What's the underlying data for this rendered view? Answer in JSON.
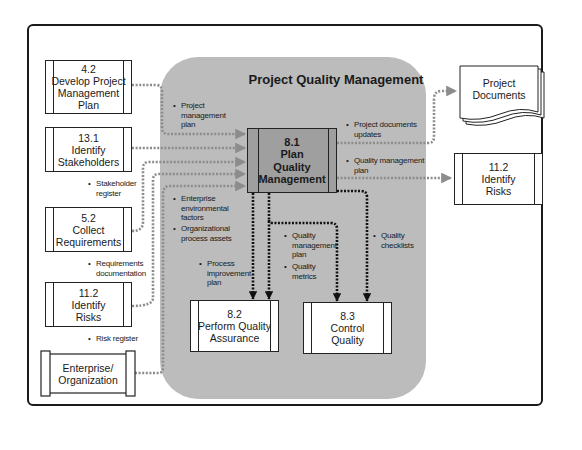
{
  "diagram": {
    "title": "Project Quality Management",
    "central_process": {
      "id": "8.1",
      "name_line1": "Plan",
      "name_line2": "Quality",
      "name_line3": "Management"
    },
    "inputs": [
      {
        "id": "4.2",
        "line1": "Develop Project",
        "line2": "Management",
        "line3": "Plan",
        "label": "Project management plan"
      },
      {
        "id": "13.1",
        "line1": "Identify",
        "line2": "Stakeholders",
        "label": "Stakeholder register"
      },
      {
        "id": "5.2",
        "line1": "Collect",
        "line2": "Requirements",
        "label": "Requirements documentation"
      },
      {
        "id": "11.2",
        "line1": "Identify",
        "line2": "Risks",
        "label": "Risk register"
      },
      {
        "line1": "Enterprise/",
        "line2": "Organization",
        "label": "Enterprise environmental factors; Organizational process assets"
      }
    ],
    "input_labels": {
      "pmp_1": "Project",
      "pmp_2": "management",
      "pmp_3": "plan",
      "sr_1": "Stakeholder",
      "sr_2": "register",
      "rd_1": "Requirements",
      "rd_2": "documentation",
      "rr_1": "Risk register",
      "eef_1": "Enterprise",
      "eef_2": "environmental",
      "eef_3": "factors",
      "opa_1": "Organizational",
      "opa_2": "process assets"
    },
    "outputs": {
      "pdu_1": "Project documents",
      "pdu_2": "updates",
      "qmp_1": "Quality management",
      "qmp_2": "plan",
      "pip_1": "Process",
      "pip_2": "improvement",
      "pip_3": "plan",
      "qmp2_1": "Quality",
      "qmp2_2": "management",
      "qmp2_3": "plan",
      "qm_1": "Quality",
      "qm_2": "metrics",
      "qc_1": "Quality",
      "qc_2": "checklists"
    },
    "targets": [
      {
        "id": "8.2",
        "line1": "Perform Quality",
        "line2": "Assurance"
      },
      {
        "id": "8.3",
        "line1": "Control",
        "line2": "Quality"
      },
      {
        "id": "11.2",
        "line1": "Identify",
        "line2": "Risks"
      },
      {
        "line1": "Project",
        "line2": "Documents"
      }
    ],
    "bullet": "•",
    "colors": {
      "region": "#bcbcbc",
      "main_box": "#9f9f9f",
      "gray_arrow": "#8c8c8c",
      "black_arrow": "#111111"
    }
  }
}
